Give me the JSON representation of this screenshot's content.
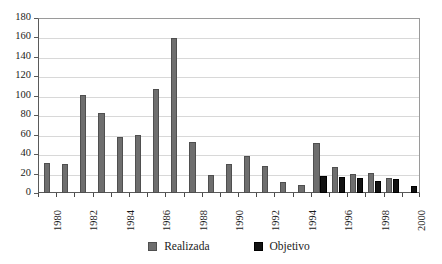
{
  "chart_data": {
    "type": "bar",
    "title": "",
    "subtitle": "",
    "xlabel": "",
    "ylabel": "",
    "ylim": [
      0,
      180
    ],
    "ytick_step": 20,
    "yticks": [
      0,
      20,
      40,
      60,
      80,
      100,
      120,
      140,
      160,
      180
    ],
    "ytick_labels": [
      "0",
      "20",
      "40",
      "60",
      "80",
      "100",
      "120",
      "140",
      "160",
      "180"
    ],
    "grid": "horizontal",
    "legend_position": "bottom-center",
    "categories": [
      "1980",
      "1981",
      "1982",
      "1983",
      "1984",
      "1985",
      "1986",
      "1987",
      "1988",
      "1989",
      "1990",
      "1991",
      "1992",
      "1993",
      "1994",
      "1995",
      "1996",
      "1997",
      "1998",
      "1999",
      "2000"
    ],
    "xtick_labels_shown": [
      "1980",
      "",
      "1982",
      "",
      "1984",
      "",
      "1986",
      "",
      "1988",
      "",
      "1990",
      "",
      "1992",
      "",
      "1994",
      "",
      "1996",
      "",
      "1998",
      "",
      "2000"
    ],
    "series": [
      {
        "name": "Realizada",
        "color": "#6e6e6e",
        "values": [
          31,
          30,
          101,
          82,
          58,
          60,
          107,
          159,
          52,
          19,
          30,
          38,
          28,
          11,
          8,
          51,
          27,
          20,
          21,
          15,
          0
        ]
      },
      {
        "name": "Objetivo",
        "color": "#121212",
        "values": [
          0,
          0,
          0,
          0,
          0,
          0,
          0,
          0,
          0,
          0,
          0,
          0,
          0,
          0,
          0,
          17,
          16,
          15,
          12,
          14,
          7
        ]
      }
    ]
  },
  "legend": {
    "entries": [
      {
        "label": "Realizada",
        "swatch": "gray-square-swatch"
      },
      {
        "label": "Objetivo",
        "swatch": "black-square-swatch"
      }
    ]
  }
}
